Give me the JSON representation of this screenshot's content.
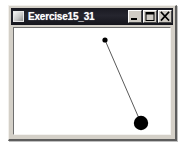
{
  "window": {
    "title": "Exercise15_31",
    "icon": "window-app-icon",
    "titlebar_color": "#1a1a22",
    "titlebar_text_color": "#ffffff",
    "frame_color": "#d4d0c8",
    "client_background": "#ffffff",
    "controls": [
      {
        "name": "minimize",
        "label": "_",
        "glyph": "minimize-icon"
      },
      {
        "name": "maximize",
        "label": "□",
        "glyph": "maximize-icon"
      },
      {
        "name": "close",
        "label": "×",
        "glyph": "close-icon"
      }
    ]
  },
  "canvas": {
    "name": "pendulum-animation-canvas",
    "width": 159,
    "height": 111,
    "background": "#ffffff",
    "pivot": {
      "x": 91,
      "y": 12,
      "radius": 2.6,
      "color": "#000000"
    },
    "bob": {
      "x": 127,
      "y": 95,
      "radius": 7.2,
      "color": "#000000"
    },
    "rod": {
      "x1": 91,
      "y1": 12,
      "x2": 127,
      "y2": 95,
      "width": 1,
      "color": "#5a5a5a"
    }
  }
}
